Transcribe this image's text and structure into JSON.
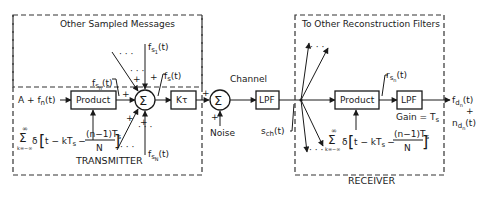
{
  "transmitter": {
    "title": "TRANSMITTER",
    "group_label": "Other Sampled Messages",
    "input": "A + f",
    "input_sub": "n",
    "input_arg": "(t)",
    "product_label": "Product",
    "gain_label": "Kτ",
    "sum_symbol": "Σ",
    "fsn_label": "f",
    "fsn_sub": "s",
    "fsn_subsub": "n",
    "fsn_arg": "(t)",
    "fs1_label": "f",
    "fs1_sub": "s",
    "fs1_subsub": "1",
    "fs1_arg": "(t)",
    "fsN_label": "f",
    "fsN_sub": "s",
    "fsN_subsub": "N",
    "fsN_arg": "(t)",
    "fs_label": "f",
    "fs_sub": "s",
    "fs_arg": "(t)",
    "plus": "+",
    "dots": "· · ·",
    "impulse_train": {
      "sum_top": "∞",
      "sum_sym": "Σ",
      "sum_bottom": "k=−∞",
      "delta": "δ",
      "expr_left": "t − kT",
      "expr_sub": "s",
      "minus": "−",
      "num": "(n−1)T",
      "num_sub": "s",
      "den": "N"
    }
  },
  "channel": {
    "title": "Channel",
    "sum_symbol": "Σ",
    "noise_label": "Noise",
    "lpf_label": "LPF",
    "sch_label": "s",
    "sch_sub": "ch",
    "sch_arg": "(t)",
    "plus": "+"
  },
  "receiver": {
    "title": "RECEIVER",
    "group_label": "To Other Reconstruction Filters",
    "product_label": "Product",
    "lpf_label": "LPF",
    "gain_label": "Gain = T",
    "gain_sub": "s",
    "rsn_label": "r",
    "rsn_sub": "s",
    "rsn_subsub": "n",
    "rsn_arg": "(t)",
    "output_f": "f",
    "output_f_sub": "d",
    "output_f_subsub": "n",
    "output_f_arg": "(t)",
    "output_plus": "+",
    "output_n": "n",
    "output_n_sub": "d",
    "output_n_subsub": "n",
    "output_n_arg": "(t)",
    "impulse_train": {
      "sum_top": "∞",
      "sum_sym": "Σ",
      "sum_bottom": "k=−∞",
      "delta": "δ",
      "expr_left": "t − kT",
      "expr_sub": "s",
      "minus": "−",
      "num": "(n−1)T",
      "num_sub": "s",
      "den": "N"
    }
  }
}
